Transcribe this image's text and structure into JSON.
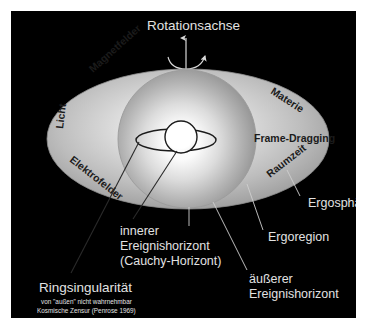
{
  "figure": {
    "title_top": "Rotationsachse",
    "background_color": "#000000",
    "page_color": "#ffffff",
    "light_text_color": "#e2e2e2",
    "dark_text_color": "#1b1b1b"
  },
  "axis": {
    "label": "Rotationsachse",
    "arrow_icon": "up-arrow-icon",
    "spin_icon": "curved-rotation-arrow-icon"
  },
  "ellipse_labels": [
    {
      "key": "magnetfelder",
      "text": "Magnetfelder",
      "rotation": -42
    },
    {
      "key": "licht",
      "text": "Licht",
      "rotation": -83
    },
    {
      "key": "elektrofelder",
      "text": "Elektrofelder",
      "rotation": 38
    },
    {
      "key": "materie",
      "text": "Materie",
      "rotation": 33
    },
    {
      "key": "frame_dragging",
      "text": "Frame-Dragging",
      "rotation": 0
    },
    {
      "key": "raumzeit",
      "text": "Raumzeit",
      "rotation": -38
    }
  ],
  "callouts": [
    {
      "key": "ergosphaere",
      "text": "Ergosphäre"
    },
    {
      "key": "ergoregion",
      "text": "Ergoregion"
    },
    {
      "key": "aeusserer_ereignishorizont",
      "line1": "äußerer",
      "line2": "Ereignishorizont"
    },
    {
      "key": "innerer_ereignishorizont",
      "line1": "innerer",
      "line2": "Ereignishorizont",
      "line3": "(Cauchy-Horizont)"
    },
    {
      "key": "ringsingularitaet",
      "text": "Ringsingularität",
      "note1": "von \"außen\" nicht wahrnehmbar",
      "note2": "Kosmische Zensur (Penrose 1969)"
    }
  ],
  "shapes": {
    "ergosphere_name": "ergosphere-ellipse",
    "outer_horizon_name": "outer-event-horizon-sphere",
    "inner_horizon_name": "inner-event-horizon-sphere",
    "ring_singularity_name": "ring-singularity-ellipse"
  }
}
